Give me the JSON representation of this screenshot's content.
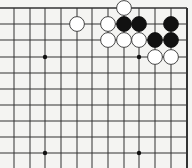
{
  "diagram": {
    "type": "go-board-fragment",
    "colors": {
      "background": "#f4f4f2",
      "line": "#333333",
      "black_stone": "#111111",
      "white_stone_fill": "#ffffff",
      "white_stone_edge": "#333333"
    },
    "grid": {
      "columns_x": [
        14,
        30,
        45,
        61,
        77,
        92,
        108,
        124,
        139,
        155,
        171,
        187
      ],
      "rows_y": [
        8,
        24,
        40,
        57,
        73,
        89,
        105,
        121,
        137,
        153
      ],
      "top_edge": true,
      "right_edge": true,
      "left_open": true,
      "bottom_open": true
    },
    "star_points": [
      {
        "col": 2,
        "row": 3
      },
      {
        "col": 8,
        "row": 3
      },
      {
        "col": 2,
        "row": 9
      },
      {
        "col": 8,
        "row": 9
      }
    ],
    "stones": [
      {
        "color": "white",
        "col": 7,
        "row": 0
      },
      {
        "color": "white",
        "col": 4,
        "row": 1
      },
      {
        "color": "white",
        "col": 6,
        "row": 1
      },
      {
        "color": "black",
        "col": 7,
        "row": 1
      },
      {
        "color": "black",
        "col": 8,
        "row": 1
      },
      {
        "color": "black",
        "col": 10,
        "row": 1
      },
      {
        "color": "white",
        "col": 6,
        "row": 2
      },
      {
        "color": "white",
        "col": 7,
        "row": 2
      },
      {
        "color": "white",
        "col": 8,
        "row": 2
      },
      {
        "color": "black",
        "col": 9,
        "row": 2
      },
      {
        "color": "black",
        "col": 10,
        "row": 2
      },
      {
        "color": "white",
        "col": 9,
        "row": 3
      },
      {
        "color": "white",
        "col": 10,
        "row": 3
      }
    ]
  }
}
